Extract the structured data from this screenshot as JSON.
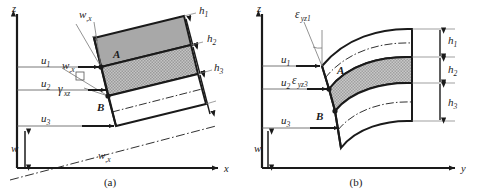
{
  "figure": {
    "background_color": "#ffffff",
    "line_color": "#1a1a1a",
    "panels": [
      {
        "caption": "(a)",
        "axes": {
          "vertical": "z",
          "horizontal": "x"
        },
        "displacement_labels": [
          "u",
          "u",
          "u"
        ],
        "displacement_subscripts": [
          "1",
          "2",
          "3"
        ],
        "thickness_labels": [
          "h",
          "h",
          "h"
        ],
        "thickness_subscripts": [
          "1",
          "2",
          "3"
        ],
        "point_labels": [
          "A",
          "B"
        ],
        "slope_label": "w",
        "slope_subscript": ",x",
        "shear_label": "γ",
        "shear_subscript": "xz",
        "deflection_label": "w",
        "layers": [
          {
            "name": "layer-1",
            "fill": "#a8a8a8",
            "thickness_label": "h",
            "thickness_subscript": "1"
          },
          {
            "name": "layer-2",
            "fill": "#bdbdbd",
            "thickness_label": "h",
            "thickness_subscript": "2"
          },
          {
            "name": "layer-3",
            "fill": "#ffffff",
            "thickness_label": "h",
            "thickness_subscript": "3"
          }
        ]
      },
      {
        "caption": "(b)",
        "axes": {
          "vertical": "z",
          "horizontal": "y"
        },
        "displacement_labels": [
          "u",
          "u",
          "u"
        ],
        "displacement_subscripts": [
          "1",
          "2",
          "3"
        ],
        "thickness_labels": [
          "h",
          "h",
          "h"
        ],
        "thickness_subscripts": [
          "1",
          "2",
          "3"
        ],
        "point_labels": [
          "A",
          "B"
        ],
        "strain_label_top": "ε",
        "strain_subscript_top": "yz1",
        "strain_label_mid": "ε",
        "strain_subscript_mid": "yz3",
        "deflection_label": "w",
        "layers": [
          {
            "name": "layer-1",
            "fill": "#ffffff",
            "thickness_label": "h",
            "thickness_subscript": "1"
          },
          {
            "name": "layer-2",
            "fill": "#bdbdbd",
            "thickness_label": "h",
            "thickness_subscript": "2"
          },
          {
            "name": "layer-3",
            "fill": "#ffffff",
            "thickness_label": "h",
            "thickness_subscript": "3"
          }
        ]
      }
    ]
  },
  "panel_a": {
    "axis_z": "z",
    "axis_x": "x",
    "u1": "u",
    "u1_sub": "1",
    "u2": "u",
    "u2_sub": "2",
    "u3": "u",
    "u3_sub": "3",
    "h1": "h",
    "h1_sub": "1",
    "h2": "h",
    "h2_sub": "2",
    "h3": "h",
    "h3_sub": "3",
    "point_a": "A",
    "point_b": "B",
    "wx_top": "w",
    "wx_top_sub": ",x",
    "wx_mid": "w",
    "wx_mid_sub": ",x",
    "wx_bottom": "w",
    "wx_bottom_sub": ",x",
    "gamma": "γ",
    "gamma_sub": "xz",
    "w": "w",
    "caption": "(a)"
  },
  "panel_b": {
    "axis_z": "z",
    "axis_y": "y",
    "u1": "u",
    "u1_sub": "1",
    "u2": "u",
    "u2_sub": "2",
    "u3": "u",
    "u3_sub": "3",
    "h1": "h",
    "h1_sub": "1",
    "h2": "h",
    "h2_sub": "2",
    "h3": "h",
    "h3_sub": "3",
    "point_a": "A",
    "point_b": "B",
    "eps1": "ε",
    "eps1_sub": "yz1",
    "eps3": "ε",
    "eps3_sub": "yz3",
    "w": "w",
    "caption": "(b)"
  }
}
